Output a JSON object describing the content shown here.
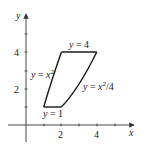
{
  "diagram": {
    "type": "region-plot",
    "axes": {
      "x_label": "x",
      "y_label": "y",
      "x_ticks": [
        1,
        2,
        3,
        4,
        5
      ],
      "x_tick_labels": [
        "2",
        "4"
      ],
      "y_ticks": [
        1,
        2,
        3,
        4,
        5
      ],
      "y_tick_labels": [
        "2",
        "4"
      ]
    },
    "curves": {
      "top": {
        "label_prefix": "y = 4"
      },
      "bottom": {
        "label_prefix": "y = 1"
      },
      "left": {
        "label_prefix": "y = x",
        "label_sup": "2"
      },
      "right": {
        "label_prefix": "y = x",
        "label_sup": "2",
        "label_suffix": "/4"
      }
    },
    "region_vertices": [
      [
        1,
        1
      ],
      [
        2,
        1
      ],
      [
        4,
        4
      ],
      [
        2,
        4
      ]
    ],
    "colors": {
      "stroke": "#1a1a1a",
      "axis": "#333333"
    }
  }
}
